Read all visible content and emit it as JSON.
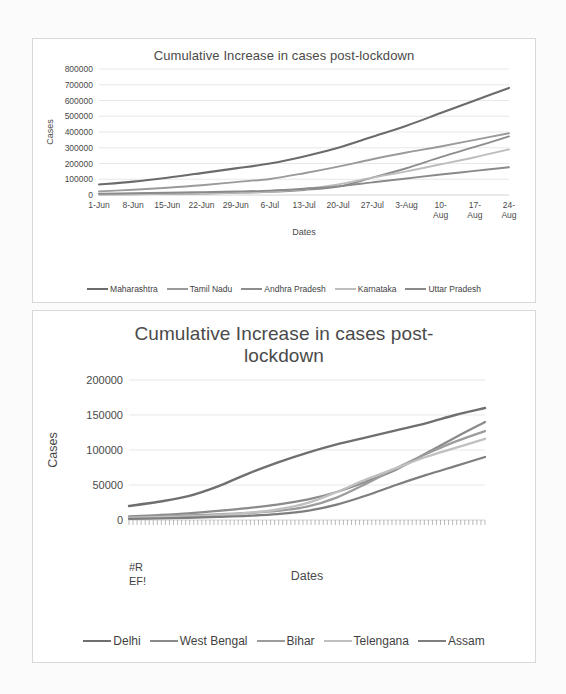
{
  "page": {
    "background_color": "#fbfbfb",
    "frame_border_color": "#d8d8d8"
  },
  "chart_data": [
    {
      "id": "chart-1",
      "type": "line",
      "title": "Cumulative Increase in cases post-lockdown",
      "xlabel": "Dates",
      "ylabel": "Cases",
      "ylim": [
        0,
        800000
      ],
      "ytick_labels": [
        "800000",
        "700000",
        "600000",
        "500000",
        "400000",
        "300000",
        "200000",
        "100000",
        "0"
      ],
      "ytick_values": [
        800000,
        700000,
        600000,
        500000,
        400000,
        300000,
        200000,
        100000,
        0
      ],
      "categories": [
        "1-Jun",
        "8-Jun",
        "15-Jun",
        "22-Jun",
        "29-Jun",
        "6-Jul",
        "13-Jul",
        "20-Jul",
        "27-Jul",
        "3-Aug",
        "10-Aug",
        "17-Aug",
        "24-Aug"
      ],
      "grid": true,
      "legend_position": "bottom",
      "series": [
        {
          "name": "Maharashtra",
          "color": "#6b6b6b",
          "width": 2.1,
          "values": [
            67000,
            85000,
            110000,
            139000,
            169000,
            200000,
            245000,
            300000,
            370000,
            440000,
            520000,
            600000,
            680000
          ]
        },
        {
          "name": "Tamil Nadu",
          "color": "#9a9a9a",
          "width": 1.9,
          "values": [
            23000,
            33000,
            46000,
            62000,
            82000,
            102000,
            138000,
            180000,
            227000,
            270000,
            308000,
            350000,
            392000
          ]
        },
        {
          "name": "Andhra Pradesh",
          "color": "#8d8d8d",
          "width": 1.9,
          "values": [
            4000,
            5000,
            7000,
            9500,
            14000,
            20000,
            32000,
            53000,
            110000,
            170000,
            240000,
            305000,
            372000
          ]
        },
        {
          "name": "Karnataka",
          "color": "#bdbdbd",
          "width": 1.9,
          "values": [
            3500,
            5500,
            8000,
            10000,
            14000,
            22000,
            38000,
            67000,
            110000,
            150000,
            195000,
            240000,
            290000
          ]
        },
        {
          "name": "Uttar Pradesh",
          "color": "#8a8a8a",
          "width": 1.9,
          "values": [
            8000,
            11000,
            14000,
            18000,
            22000,
            28000,
            40000,
            55000,
            80000,
            105000,
            130000,
            153000,
            176000
          ]
        }
      ]
    },
    {
      "id": "chart-2",
      "type": "line",
      "title_line_1": "Cumulative Increase in cases post-",
      "title_line_2": "lockdown",
      "title": "Cumulative Increase in cases post-lockdown",
      "xlabel": "Dates",
      "ylabel": "Cases",
      "x_axis_error_label": "#REF!",
      "x_axis_error_label_line_1": "#R",
      "x_axis_error_label_line_2": "EF!",
      "ylim": [
        0,
        200000
      ],
      "ytick_labels": [
        "200000",
        "150000",
        "100000",
        "50000",
        "0"
      ],
      "ytick_values": [
        200000,
        150000,
        100000,
        50000,
        0
      ],
      "grid": true,
      "legend_position": "bottom",
      "tick_count": 88,
      "series": [
        {
          "name": "Delhi",
          "color": "#6f6f6f",
          "width": 2.4,
          "values": [
            20000,
            26000,
            34000,
            48000,
            66000,
            82000,
            96000,
            108000,
            118000,
            128000,
            138000,
            150000,
            160000
          ]
        },
        {
          "name": "West Bengal",
          "color": "#8b8b8b",
          "width": 2.3,
          "values": [
            5000,
            7000,
            9500,
            13000,
            17000,
            22000,
            29000,
            40000,
            55000,
            72000,
            95000,
            118000,
            140000
          ]
        },
        {
          "name": "Bihar",
          "color": "#9c9c9c",
          "width": 2.3,
          "values": [
            4000,
            5000,
            6500,
            8000,
            10000,
            13000,
            19000,
            32000,
            52000,
            74000,
            94000,
            112000,
            127000
          ]
        },
        {
          "name": "Telengana",
          "color": "#c0c0c0",
          "width": 2.3,
          "values": [
            3000,
            4000,
            5000,
            7000,
            10000,
            15000,
            24000,
            40000,
            58000,
            74000,
            90000,
            103000,
            116000
          ]
        },
        {
          "name": "Assam",
          "color": "#7e7e7e",
          "width": 2.3,
          "values": [
            1500,
            2200,
            3200,
            4500,
            6000,
            8500,
            13000,
            22000,
            35000,
            50000,
            64000,
            77000,
            90000
          ]
        }
      ]
    }
  ]
}
